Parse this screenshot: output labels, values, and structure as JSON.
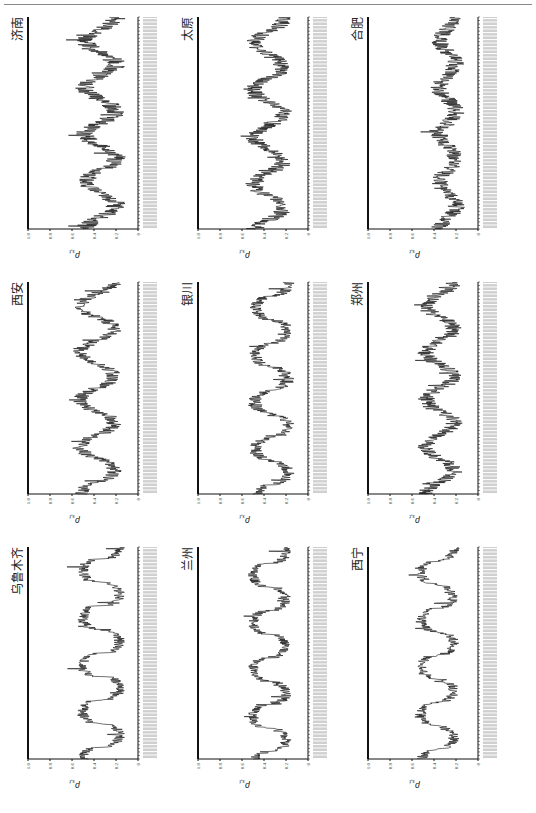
{
  "header": {
    "text": "第二章 空气质量的时空分布特征"
  },
  "layout": {
    "rotation_deg": -90,
    "rows": 3,
    "cols": 3,
    "line_color": "#111111",
    "date_label_color": "#999999"
  },
  "chart_data": {
    "type": "line",
    "ylabel": "ρ_{s,t}",
    "ylim": [
      0,
      1.0
    ],
    "yticks": [
      "0",
      "0.2",
      "0.4",
      "0.6",
      "0.8",
      "1.0"
    ],
    "xlabel": "date (daily ticks, illegible)",
    "grid": false,
    "legend": "none",
    "panels": [
      {
        "title": "乌鲁木齐",
        "row": 0,
        "col": 0,
        "cycles": 4.5,
        "base": 0.17,
        "amp": 0.33,
        "noise": 0.05,
        "phase": 0.0,
        "sharp": 3.0
      },
      {
        "title": "兰州",
        "row": 0,
        "col": 1,
        "cycles": 4.5,
        "base": 0.2,
        "amp": 0.3,
        "noise": 0.05,
        "phase": 0.1,
        "sharp": 2.4
      },
      {
        "title": "西宁",
        "row": 0,
        "col": 2,
        "cycles": 4.5,
        "base": 0.22,
        "amp": 0.3,
        "noise": 0.05,
        "phase": 0.05,
        "sharp": 2.0
      },
      {
        "title": "西安",
        "row": 1,
        "col": 0,
        "cycles": 4.5,
        "base": 0.22,
        "amp": 0.3,
        "noise": 0.07,
        "phase": 0.0,
        "sharp": 1.3
      },
      {
        "title": "银川",
        "row": 1,
        "col": 1,
        "cycles": 4.5,
        "base": 0.18,
        "amp": 0.3,
        "noise": 0.06,
        "phase": 0.05,
        "sharp": 1.8
      },
      {
        "title": "郑州",
        "row": 1,
        "col": 2,
        "cycles": 4.5,
        "base": 0.22,
        "amp": 0.25,
        "noise": 0.08,
        "phase": 0.0,
        "sharp": 1.2
      },
      {
        "title": "济南",
        "row": 2,
        "col": 0,
        "cycles": 4.5,
        "base": 0.2,
        "amp": 0.28,
        "noise": 0.09,
        "phase": 0.0,
        "sharp": 1.0
      },
      {
        "title": "太原",
        "row": 2,
        "col": 1,
        "cycles": 4.5,
        "base": 0.22,
        "amp": 0.27,
        "noise": 0.08,
        "phase": 0.05,
        "sharp": 1.1
      },
      {
        "title": "合肥",
        "row": 2,
        "col": 2,
        "cycles": 4.5,
        "base": 0.2,
        "amp": 0.15,
        "noise": 0.08,
        "phase": 0.0,
        "sharp": 1.0
      }
    ]
  }
}
